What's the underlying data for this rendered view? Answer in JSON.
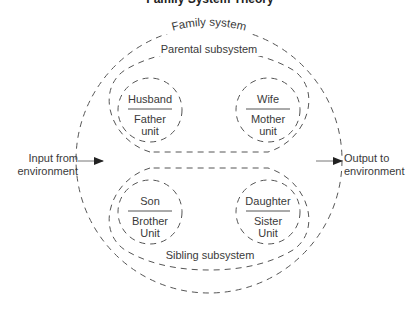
{
  "diagram": {
    "title_cut": "Family System Theory",
    "family_system": "Family system",
    "parental_subsystem": "Parental subsystem",
    "sibling_subsystem": "Sibling subsystem",
    "units": {
      "husband": {
        "top": "Husband",
        "bottom_1": "Father",
        "bottom_2": "unit"
      },
      "wife": {
        "top": "Wife",
        "bottom_1": "Mother",
        "bottom_2": "unit"
      },
      "son": {
        "top": "Son",
        "bottom_1": "Brother",
        "bottom_2": "Unit"
      },
      "daughter": {
        "top": "Daughter",
        "bottom_1": "Sister",
        "bottom_2": "Unit"
      }
    },
    "input": {
      "line1": "Input from",
      "line2": "environment"
    },
    "output": {
      "line1": "Output to",
      "line2": "environment"
    },
    "stroke_color": "#555555"
  }
}
